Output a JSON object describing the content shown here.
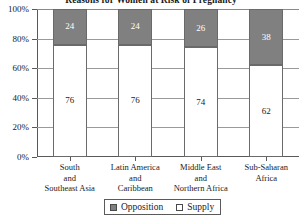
{
  "chart_data": {
    "type": "bar",
    "subtype": "stacked-percentage",
    "title": "Reasons for Women at Risk of Pregnancy",
    "xlabel": "",
    "ylabel": "",
    "ylim": [
      0,
      100
    ],
    "yticks": [
      0,
      20,
      40,
      60,
      80,
      100
    ],
    "ytick_labels": [
      "0%",
      "20%",
      "40%",
      "60%",
      "80%",
      "100%"
    ],
    "grid": true,
    "legend_position": "bottom",
    "categories": [
      "South and Southeast Asia",
      "Latin America and Caribbean",
      "Middle East and Northern Africa",
      "Sub-Saharan Africa"
    ],
    "category_lines": [
      [
        "South",
        "and",
        "Southeast Asia"
      ],
      [
        "Latin America",
        "and",
        "Caribbean"
      ],
      [
        "Middle East",
        "and",
        "Northern Africa"
      ],
      [
        "Sub-Saharan",
        "Africa"
      ]
    ],
    "series": [
      {
        "name": "Supply",
        "color": "#ffffff",
        "values": [
          76,
          76,
          74,
          62
        ]
      },
      {
        "name": "Opposition",
        "color": "#808080",
        "values": [
          24,
          24,
          26,
          38
        ]
      }
    ]
  },
  "legend": {
    "items": [
      {
        "label": "Opposition",
        "swatch": "filled"
      },
      {
        "label": "Supply",
        "swatch": "empty"
      }
    ]
  },
  "colors": {
    "opposition": "#808080",
    "supply": "#ffffff",
    "axis": "#595959",
    "grid": "#9a9a9a"
  }
}
